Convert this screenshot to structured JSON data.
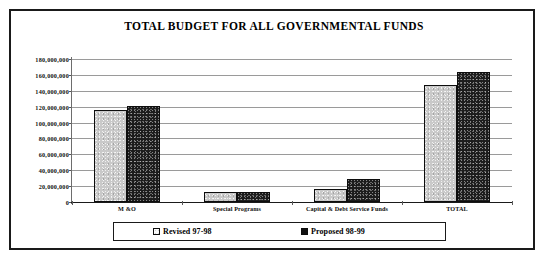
{
  "chart_data": {
    "type": "bar",
    "title": "TOTAL BUDGET FOR ALL GOVERNMENTAL FUNDS",
    "xlabel": "",
    "ylabel": "",
    "categories": [
      "M &O",
      "Special Programs",
      "Capital & Debt Service Funds",
      "TOTAL"
    ],
    "series": [
      {
        "name": "Revised 97-98",
        "color": "#c9c9c9",
        "values": [
          116000000,
          13000000,
          16000000,
          147000000
        ]
      },
      {
        "name": "Proposed 98-99",
        "color": "#1c1c1c",
        "values": [
          121000000,
          13000000,
          29000000,
          164000000
        ]
      }
    ],
    "ylim": [
      0,
      180000000
    ],
    "ytick_step": 20000000,
    "ytick_labels": [
      "180,000,000",
      "160,000,000",
      "140,000,000",
      "120,000,000",
      "100,000,000",
      "80,000,000",
      "60,000,000",
      "40,000,000",
      "20,000,000",
      "0"
    ],
    "ytick_values": [
      180000000,
      160000000,
      140000000,
      120000000,
      100000000,
      80000000,
      60000000,
      40000000,
      20000000,
      0
    ],
    "grid": true,
    "legend_position": "bottom"
  },
  "legend": {
    "entries": [
      {
        "label": "Revised 97-98",
        "swatch": "light-hatched-square"
      },
      {
        "label": "Proposed 98-99",
        "swatch": "solid-black-square"
      }
    ]
  },
  "colors": {
    "frame": "#1a1a1a",
    "gridline": "#9a9a9a",
    "revised_bar": "#c9c9c9",
    "proposed_bar": "#1c1c1c",
    "background": "#ffffff"
  }
}
